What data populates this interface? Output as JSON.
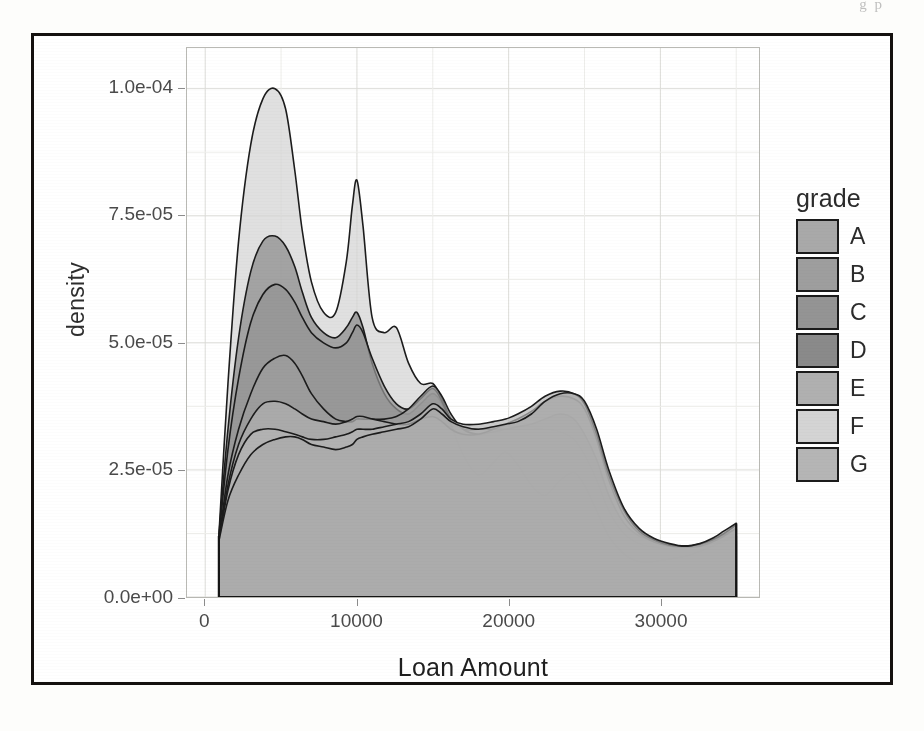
{
  "scan": {
    "top_artifact_text": "g p"
  },
  "chart_data": {
    "type": "area",
    "title": "",
    "subtitle": "",
    "xlabel": "Loan Amount",
    "ylabel": "density",
    "xlim": [
      -1200,
      36500
    ],
    "ylim": [
      0,
      0.000108
    ],
    "grid": true,
    "legend_position": "right",
    "legend_title": "grade",
    "x_ticks": [
      0,
      10000,
      20000,
      30000
    ],
    "x_tick_labels": [
      "0",
      "10000",
      "20000",
      "30000"
    ],
    "y_ticks": [
      0,
      2.5e-05,
      5e-05,
      7.5e-05,
      0.0001
    ],
    "y_tick_labels": [
      "0.0e+00",
      "2.5e-05",
      "5.0e-05",
      "7.5e-05",
      "1.0e-04"
    ],
    "y_minor_ticks": [
      1.25e-05,
      3.75e-05,
      6.25e-05,
      8.75e-05
    ],
    "x_minor_ticks": [
      5000,
      15000,
      25000,
      35000
    ],
    "note": "Overlaid kernel-density curves of loan amount, one filled translucent grey area per credit grade A-G.",
    "x": [
      900,
      1500,
      2200,
      3000,
      3800,
      4600,
      5300,
      5900,
      6400,
      7000,
      7800,
      8600,
      9300,
      9700,
      10000,
      10400,
      11000,
      11800,
      12600,
      13400,
      14200,
      15000,
      15600,
      16200,
      17000,
      18000,
      19000,
      19800,
      20600,
      21500,
      22400,
      23400,
      24300,
      25000,
      25800,
      26600,
      27600,
      28600,
      29600,
      30600,
      31600,
      32600,
      33400,
      34200,
      35000
    ],
    "series": [
      {
        "name": "A",
        "color": "#a9a9a9",
        "values": [
          1.1e-05,
          1.9e-05,
          2.4e-05,
          2.8e-05,
          3e-05,
          3.1e-05,
          3.15e-05,
          3.15e-05,
          3.1e-05,
          3e-05,
          2.95e-05,
          2.9e-05,
          2.95e-05,
          3e-05,
          3.1e-05,
          3.15e-05,
          3.2e-05,
          3.25e-05,
          3.3e-05,
          3.35e-05,
          3.5e-05,
          3.7e-05,
          3.6e-05,
          3.45e-05,
          3.35e-05,
          3.3e-05,
          3.35e-05,
          3.4e-05,
          3.45e-05,
          3.6e-05,
          3.85e-05,
          4e-05,
          4e-05,
          3.85e-05,
          3.3e-05,
          2.5e-05,
          1.75e-05,
          1.35e-05,
          1.15e-05,
          1.05e-05,
          1e-05,
          1.05e-05,
          1.15e-05,
          1.3e-05,
          1.45e-05
        ]
      },
      {
        "name": "B",
        "color": "#9e9e9e",
        "values": [
          1.1e-05,
          2.4e-05,
          3.3e-05,
          4e-05,
          4.5e-05,
          4.7e-05,
          4.75e-05,
          4.6e-05,
          4.35e-05,
          4e-05,
          3.7e-05,
          3.5e-05,
          3.45e-05,
          3.45e-05,
          3.5e-05,
          3.5e-05,
          3.5e-05,
          3.5e-05,
          3.55e-05,
          3.7e-05,
          3.95e-05,
          4.15e-05,
          3.95e-05,
          3.6e-05,
          3.3e-05,
          3.2e-05,
          3.25e-05,
          3.3e-05,
          3.35e-05,
          3.4e-05,
          3.5e-05,
          3.6e-05,
          3.5e-05,
          3.2e-05,
          2.7e-05,
          2e-05,
          1.45e-05,
          1.2e-05,
          1.1e-05,
          1.02e-05,
          1e-05,
          1.02e-05,
          1.1e-05,
          1.22e-05,
          1.35e-05
        ]
      },
      {
        "name": "C",
        "color": "#949494",
        "values": [
          1.15e-05,
          2.9e-05,
          4.3e-05,
          5.4e-05,
          5.95e-05,
          6.15e-05,
          6.05e-05,
          5.8e-05,
          5.5e-05,
          5.2e-05,
          5e-05,
          4.9e-05,
          5e-05,
          5.2e-05,
          5.35e-05,
          5.2e-05,
          4.7e-05,
          4.15e-05,
          3.8e-05,
          3.7e-05,
          3.9e-05,
          4.1e-05,
          3.85e-05,
          3.4e-05,
          2.8e-05,
          2.4e-05,
          2.65e-05,
          2.85e-05,
          2.6e-05,
          2.2e-05,
          2e-05,
          2.3e-05,
          2.45e-05,
          2.2e-05,
          1.7e-05,
          1.2e-05,
          8.5e-06,
          7e-06,
          7e-06,
          7.5e-06,
          8e-06,
          9e-06,
          1e-05,
          1.1e-05,
          1.2e-05
        ]
      },
      {
        "name": "D",
        "color": "#8a8a8a",
        "values": [
          1.2e-05,
          3.3e-05,
          5.1e-05,
          6.4e-05,
          7e-05,
          7.1e-05,
          6.9e-05,
          6.5e-05,
          6e-05,
          5.5e-05,
          5.2e-05,
          5.1e-05,
          5.3e-05,
          5.5e-05,
          5.6e-05,
          5.3e-05,
          4.6e-05,
          4e-05,
          3.7e-05,
          3.6e-05,
          3.8e-05,
          4e-05,
          3.8e-05,
          3.3e-05,
          2.6e-05,
          2.2e-05,
          2.5e-05,
          2.7e-05,
          2.4e-05,
          2e-05,
          1.85e-05,
          2.1e-05,
          2.25e-05,
          2e-05,
          1.5e-05,
          1.05e-05,
          7.5e-06,
          6.2e-06,
          6.2e-06,
          6.8e-06,
          7.5e-06,
          8.2e-06,
          9e-06,
          1e-05,
          1.1e-05
        ]
      },
      {
        "name": "E",
        "color": "#b0b0b0",
        "values": [
          1.05e-05,
          2.2e-05,
          3e-05,
          3.5e-05,
          3.8e-05,
          3.85e-05,
          3.8e-05,
          3.7e-05,
          3.6e-05,
          3.5e-05,
          3.45e-05,
          3.4e-05,
          3.45e-05,
          3.5e-05,
          3.55e-05,
          3.55e-05,
          3.5e-05,
          3.45e-05,
          3.4e-05,
          3.4e-05,
          3.5e-05,
          3.55e-05,
          3.45e-05,
          3.3e-05,
          3.2e-05,
          3.2e-05,
          3.3e-05,
          3.4e-05,
          3.5e-05,
          3.65e-05,
          3.85e-05,
          3.95e-05,
          3.9e-05,
          3.7e-05,
          3.1e-05,
          2.3e-05,
          1.6e-05,
          1.25e-05,
          1.08e-05,
          1e-05,
          9.8e-06,
          1e-05,
          1.08e-05,
          1.2e-05,
          1.35e-05
        ]
      },
      {
        "name": "F",
        "color": "#d4d4d4",
        "values": [
          1.2e-05,
          4.2e-05,
          7e-05,
          8.9e-05,
          9.8e-05,
          0.0001,
          9.6e-05,
          8.4e-05,
          7.2e-05,
          6.2e-05,
          5.6e-05,
          5.6e-05,
          6.6e-05,
          7.7e-05,
          8.2e-05,
          7.3e-05,
          5.5e-05,
          5.2e-05,
          5.3e-05,
          4.6e-05,
          4.2e-05,
          4.2e-05,
          3.9e-05,
          3.5e-05,
          3.3e-05,
          3.3e-05,
          3.3e-05,
          3.3e-05,
          3.3e-05,
          3.3e-05,
          3.3e-05,
          3.25e-05,
          3.1e-05,
          2.8e-05,
          2.3e-05,
          1.7e-05,
          1.25e-05,
          1.05e-05,
          9.8e-06,
          9.5e-06,
          9.5e-06,
          1e-05,
          1.05e-05,
          1.12e-05,
          1.2e-05
        ]
      },
      {
        "name": "G",
        "color": "#b5b5b5",
        "values": [
          1.1e-05,
          2.1e-05,
          2.8e-05,
          3.2e-05,
          3.3e-05,
          3.3e-05,
          3.25e-05,
          3.2e-05,
          3.15e-05,
          3.1e-05,
          3.1e-05,
          3.15e-05,
          3.2e-05,
          3.25e-05,
          3.3e-05,
          3.3e-05,
          3.3e-05,
          3.35e-05,
          3.4e-05,
          3.45e-05,
          3.6e-05,
          3.8e-05,
          3.7e-05,
          3.5e-05,
          3.4e-05,
          3.4e-05,
          3.45e-05,
          3.5e-05,
          3.6e-05,
          3.75e-05,
          3.95e-05,
          4.05e-05,
          4e-05,
          3.8e-05,
          3.2e-05,
          2.4e-05,
          1.7e-05,
          1.3e-05,
          1.12e-05,
          1.02e-05,
          1e-05,
          1.04e-05,
          1.12e-05,
          1.25e-05,
          1.42e-05
        ]
      }
    ]
  },
  "axes": {
    "y_title": "density",
    "x_title": "Loan Amount"
  },
  "legend": {
    "title": "grade",
    "items": [
      {
        "label": "A",
        "color": "#a9a9a9"
      },
      {
        "label": "B",
        "color": "#9e9e9e"
      },
      {
        "label": "C",
        "color": "#949494"
      },
      {
        "label": "D",
        "color": "#8a8a8a"
      },
      {
        "label": "E",
        "color": "#b0b0b0"
      },
      {
        "label": "F",
        "color": "#d4d4d4"
      },
      {
        "label": "G",
        "color": "#b5b5b5"
      }
    ]
  }
}
